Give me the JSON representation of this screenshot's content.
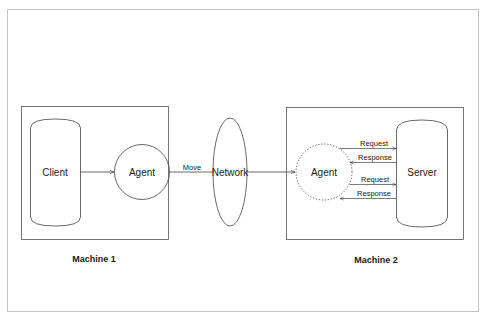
{
  "diagram": {
    "machines": [
      {
        "id": "machine1",
        "caption": "Machine 1"
      },
      {
        "id": "machine2",
        "caption": "Machine 2"
      }
    ],
    "nodes": {
      "client": {
        "label": "Client",
        "shape": "cylinder"
      },
      "agent1": {
        "label": "Agent",
        "shape": "circle"
      },
      "network": {
        "label": "Network",
        "shape": "ellipse"
      },
      "agent2": {
        "label": "Agent",
        "shape": "dotted-circle"
      },
      "server": {
        "label": "Server",
        "shape": "cylinder"
      }
    },
    "edges": {
      "client_agent": {
        "from": "Client",
        "to": "Agent",
        "label": ""
      },
      "move": {
        "from": "Agent",
        "to": "Network",
        "label": "Move"
      },
      "network_agent": {
        "from": "Network",
        "to": "Agent",
        "label": ""
      },
      "request1": {
        "from": "Agent",
        "to": "Server",
        "label": "Request"
      },
      "response1": {
        "from": "Server",
        "to": "Agent",
        "label": "Response"
      },
      "request2": {
        "from": "Agent",
        "to": "Server",
        "label": "Request"
      },
      "response2": {
        "from": "Server",
        "to": "Agent",
        "label": "Response"
      }
    },
    "colors": {
      "stroke": "#333333",
      "frame": "#bfbfbf",
      "background": "#ffffff"
    }
  }
}
